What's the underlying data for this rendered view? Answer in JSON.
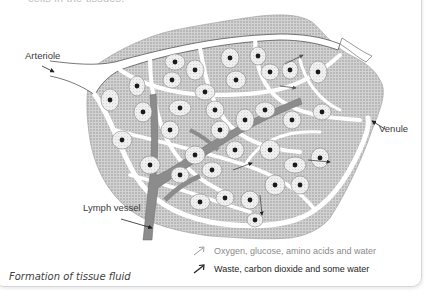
{
  "header": {
    "partial_text": "cells in the tissues."
  },
  "diagram": {
    "title": "Formation of tissue fluid",
    "labels": {
      "arteriole": "Arteriole",
      "venule": "Venule",
      "lymph_vessel": "Lymph vessel"
    },
    "legend": [
      {
        "icon": "light-arrow-icon",
        "text": "Oxygen, glucose, amino acids and water",
        "color": "#9a9a9a"
      },
      {
        "icon": "dark-arrow-icon",
        "text": "Waste, carbon dioxide and some water",
        "color": "#1e1e1e"
      }
    ]
  },
  "colors": {
    "tissue_fill": "#c8c8c8",
    "cell_fill": "#ececec",
    "nucleus": "#1a1a1a",
    "vessel": "#ffffff",
    "lymph": "#8c8c8c",
    "frame_border": "#d6d6d6"
  }
}
